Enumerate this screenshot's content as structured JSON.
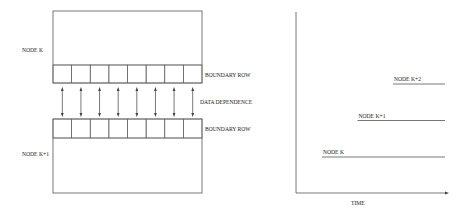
{
  "left_diagram": {
    "top_node_label": "NODE K",
    "bottom_node_label": "NODE K+1",
    "top_boundary_label": "BOUNDARY ROW",
    "bottom_boundary_label": "BOUNDARY ROW",
    "dependence_label": "DATA DEPENDENCE",
    "boundary_cells": 8,
    "dependence_arrows": 8
  },
  "right_diagram": {
    "x_axis_label": "TIME",
    "timelines": [
      {
        "label": "NODE K",
        "start_step": 0
      },
      {
        "label": "NODE K+1",
        "start_step": 1
      },
      {
        "label": "NODE K+2",
        "start_step": 2
      }
    ]
  }
}
